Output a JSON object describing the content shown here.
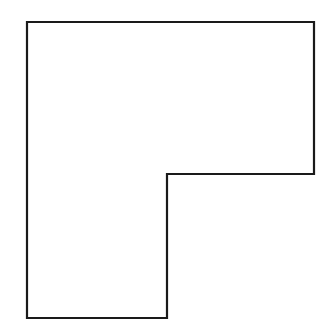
{
  "diagram": {
    "shape": "L-shape outline",
    "stroke_color": "#1a1a1a",
    "fill_color": "#ffffff",
    "points": "27,22 314,22 314,174 167,174 167,318 27,318"
  }
}
